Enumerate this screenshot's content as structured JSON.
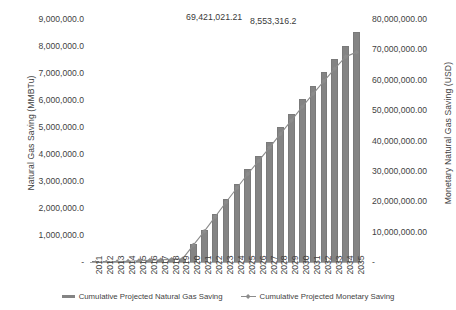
{
  "chart_data": {
    "type": "bar",
    "title": "",
    "subtitle": "",
    "xlabel": "",
    "ylabel": "Natural Gas Saving (MMBTu)",
    "y2label": "Monetary Natural Gas Saving (USD)",
    "grid": false,
    "legend_position": "bottom",
    "categories": [
      "2011",
      "2012",
      "2013",
      "2014",
      "2015",
      "2016",
      "2017",
      "2018",
      "2019",
      "2020",
      "2021",
      "2022",
      "2023",
      "2024",
      "2025",
      "2026",
      "2027",
      "2028",
      "2029",
      "2030",
      "2031",
      "2032",
      "2033",
      "2034",
      "2035"
    ],
    "ylim": [
      0,
      9000000
    ],
    "y2lim": [
      0,
      80000000
    ],
    "ytick_labels": [
      "9,000,000.0",
      "8,000,000.0",
      "7,000,000.0",
      "6,000,000.0",
      "5,000,000.0",
      "4,000,000.0",
      "3,000,000.0",
      "2,000,000.0",
      "1,000,000.0",
      "-"
    ],
    "ytick_values": [
      9000000,
      8000000,
      7000000,
      6000000,
      5000000,
      4000000,
      3000000,
      2000000,
      1000000,
      0
    ],
    "y2tick_labels": [
      "80,000,000.00",
      "70,000,000.00",
      "60,000,000.00",
      "50,000,000.00",
      "40,000,000.00",
      "30,000,000.00",
      "20,000,000.00",
      "10,000,000.00",
      "-"
    ],
    "y2tick_values": [
      80000000,
      70000000,
      60000000,
      50000000,
      40000000,
      30000000,
      20000000,
      10000000,
      0
    ],
    "series": [
      {
        "name": "Cumulative Projected Natural Gas Saving",
        "type": "bar",
        "axis": "left",
        "units": "MMBTu",
        "color": "#848484",
        "values": [
          18000,
          36000,
          54000,
          72000,
          90000,
          108000,
          126000,
          144000,
          162000,
          700000,
          1230000,
          1800000,
          2370000,
          2930000,
          3470000,
          3960000,
          4480000,
          5020000,
          5530000,
          6070000,
          6570000,
          7070000,
          7550000,
          8020000,
          8553316.2
        ],
        "data_labels": {
          "2035": "8,553,316.2"
        }
      },
      {
        "name": "Cumulative Projected Monetary Saving",
        "type": "line",
        "axis": "right",
        "units": "USD",
        "color": "#8c8c8c",
        "marker": "diamond",
        "values": [
          150000,
          300000,
          450000,
          600000,
          750000,
          900000,
          1050000,
          1200000,
          1350000,
          5900000,
          10400000,
          15200000,
          20000000,
          24700000,
          29300000,
          33600000,
          38000000,
          42500000,
          46900000,
          51400000,
          55700000,
          59900000,
          64000000,
          67900000,
          69421021.21
        ],
        "data_labels": {
          "2035": "69,421,021.21"
        }
      }
    ],
    "annotations": [
      {
        "name": "bar-value-2035",
        "text": "8,553,316.2"
      },
      {
        "name": "line-value-2035",
        "text": "69,421,021.21"
      }
    ],
    "colors": {
      "bar": "#848484",
      "line": "#8c8c8c",
      "axis": "#a6a6a6",
      "text": "#3f3f3f",
      "background": "#ffffff"
    }
  }
}
